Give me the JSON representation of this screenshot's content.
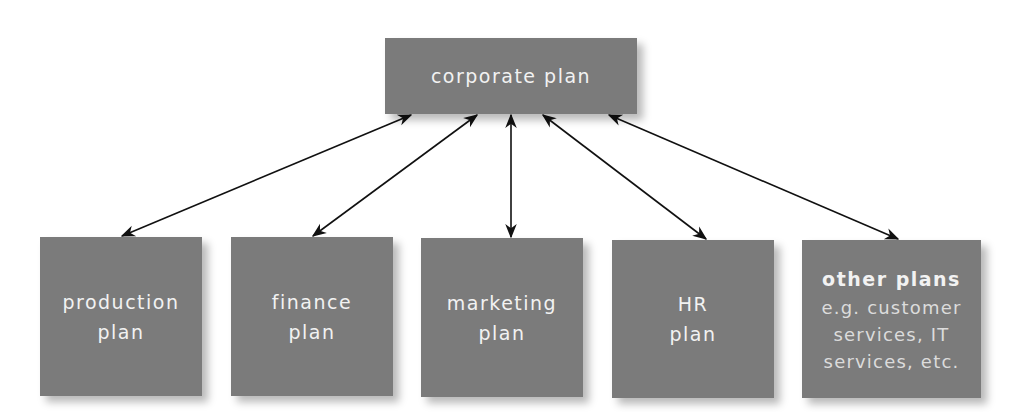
{
  "diagram": {
    "colors": {
      "box": "#7b7b7b",
      "text": "#f2f2f2",
      "arrow": "#111111",
      "background": "#ffffff"
    },
    "top": {
      "label": "corporate plan"
    },
    "bottom": [
      {
        "line1": "production",
        "line2": "plan"
      },
      {
        "line1": "finance",
        "line2": "plan"
      },
      {
        "line1": "marketing",
        "line2": "plan"
      },
      {
        "line1": "HR",
        "line2": "plan"
      },
      {
        "title": "other plans",
        "sub1": "e.g. customer",
        "sub2": "services, IT",
        "sub3": "services, etc."
      }
    ],
    "connectors": "bidirectional arrows linking corporate plan to each functional plan"
  }
}
